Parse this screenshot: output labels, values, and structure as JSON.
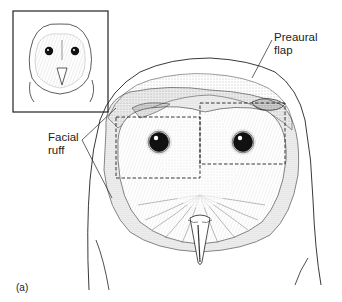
{
  "figure": {
    "panel_label": "(a)",
    "labels": {
      "preaural_flap": {
        "line1": "Preaural",
        "line2": "flap"
      },
      "facial_ruff": {
        "line1": "Facial",
        "line2": "ruff"
      }
    },
    "inset": {
      "description": "small full-head barn owl thumbnail"
    },
    "colors": {
      "ink": "#222222",
      "background": "#ffffff"
    }
  }
}
